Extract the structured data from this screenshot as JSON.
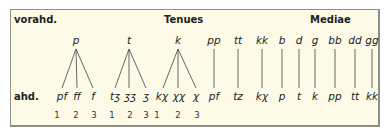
{
  "headers": {
    "left": "vorahd.",
    "tenues": "Tenues",
    "mediae": "Mediae",
    "bottom_left": "ahd."
  },
  "tenues_trees": [
    {
      "source": "p",
      "outcomes": [
        "pf",
        "ff",
        "f"
      ],
      "numbers": [
        "1",
        "2",
        "3"
      ]
    },
    {
      "source": "t",
      "outcomes": [
        "tʒ",
        "ʒʒ",
        "ʒ"
      ],
      "numbers": [
        "1",
        "2",
        "3"
      ]
    },
    {
      "source": "k",
      "outcomes": [
        "kχ",
        "χχ",
        "χ"
      ],
      "numbers": [
        "1",
        "2",
        "3"
      ]
    }
  ],
  "tenues_geminates": [
    {
      "source": "pp",
      "outcome": "pf"
    },
    {
      "source": "tt",
      "outcome": "tz"
    },
    {
      "source": "kk",
      "outcome": "kχ"
    }
  ],
  "mediae": [
    {
      "source": "b",
      "outcome": "p"
    },
    {
      "source": "d",
      "outcome": "t"
    },
    {
      "source": "g",
      "outcome": "k"
    },
    {
      "source": "bb",
      "outcome": "pp"
    },
    {
      "source": "dd",
      "outcome": "tt"
    },
    {
      "source": "gg",
      "outcome": "kk"
    }
  ],
  "colors": {
    "background": "#fdfbe8",
    "border": "#8f8f8a",
    "lines": "#555555",
    "text": "#222222"
  }
}
